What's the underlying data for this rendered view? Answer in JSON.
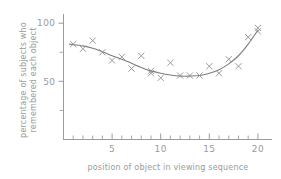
{
  "chart_data": {
    "type": "scatter",
    "title": "",
    "subtitle": "",
    "xlabel": "position of object in viewing sequence",
    "ylabel": "percentage of subjects who remembered each object",
    "ylabel_line1": "percentage of subjects who",
    "ylabel_line2": "remembered each object",
    "xlim": [
      0,
      20.8
    ],
    "ylim": [
      0,
      108
    ],
    "grid": false,
    "legend": null,
    "legend_position": "none",
    "marker_style": "x",
    "x_ticks_major": [
      5,
      10,
      15,
      20
    ],
    "x_ticks_major_labels": [
      "5",
      "10",
      "15",
      "20"
    ],
    "x_ticks_minor": [
      1,
      2,
      3,
      4,
      6,
      7,
      8,
      9,
      11,
      12,
      13,
      14,
      16,
      17,
      18,
      19
    ],
    "y_ticks_major": [
      50,
      100
    ],
    "y_ticks_major_labels": [
      "50",
      "100"
    ],
    "y_ticks_minor": [
      25,
      75
    ],
    "x": [
      1,
      2,
      3,
      4,
      5,
      6,
      7,
      8,
      9,
      9,
      10,
      11,
      12,
      13,
      14,
      15,
      16,
      17,
      18,
      19,
      20,
      20
    ],
    "values": [
      82,
      78,
      85,
      75,
      68,
      71,
      61,
      72,
      59,
      57,
      53,
      66,
      55,
      55,
      55,
      63,
      57,
      69,
      63,
      88,
      96,
      93
    ],
    "points": [
      {
        "x": 1,
        "y": 82
      },
      {
        "x": 2,
        "y": 78
      },
      {
        "x": 3,
        "y": 85
      },
      {
        "x": 4,
        "y": 75
      },
      {
        "x": 5,
        "y": 68
      },
      {
        "x": 6,
        "y": 71
      },
      {
        "x": 7,
        "y": 61
      },
      {
        "x": 8,
        "y": 72
      },
      {
        "x": 9,
        "y": 59
      },
      {
        "x": 9,
        "y": 57
      },
      {
        "x": 10,
        "y": 53
      },
      {
        "x": 11,
        "y": 66
      },
      {
        "x": 12,
        "y": 55
      },
      {
        "x": 13,
        "y": 55
      },
      {
        "x": 14,
        "y": 55
      },
      {
        "x": 15,
        "y": 63
      },
      {
        "x": 16,
        "y": 57
      },
      {
        "x": 17,
        "y": 69
      },
      {
        "x": 18,
        "y": 63
      },
      {
        "x": 19,
        "y": 88
      },
      {
        "x": 20,
        "y": 96
      },
      {
        "x": 20,
        "y": 93
      }
    ],
    "fit_curve": {
      "name": "fitted trend curve",
      "x": [
        0.6,
        2,
        3,
        4,
        5,
        6,
        7,
        8,
        9,
        10,
        11,
        12,
        13,
        14,
        15,
        16,
        17,
        18,
        19,
        20
      ],
      "y": [
        82,
        80.5,
        78.5,
        75.5,
        72,
        69,
        65.5,
        62,
        59,
        57,
        55.5,
        54.5,
        54.5,
        55,
        57,
        60,
        65,
        72,
        82,
        94
      ]
    },
    "colors": {
      "axis": "#9b9b9b",
      "marker": "#8f8f8f",
      "curve": "#7d7d7d",
      "text": "#9a9a9a",
      "background": "#ffffff"
    }
  }
}
